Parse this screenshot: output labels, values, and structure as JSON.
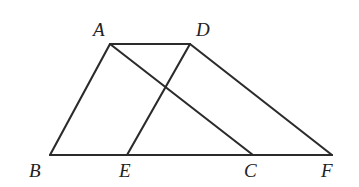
{
  "figure": {
    "background_color": "#ffffff",
    "stroke_color": "#2b2b2b",
    "label_color": "#23211f",
    "width": 359,
    "height": 187,
    "points": {
      "A": {
        "label": "A",
        "x": 110,
        "y": 44,
        "label_x": 93,
        "label_y": 20
      },
      "D": {
        "label": "D",
        "x": 190,
        "y": 44,
        "label_x": 196,
        "label_y": 20
      },
      "B": {
        "label": "B",
        "x": 50,
        "y": 155,
        "label_x": 29,
        "label_y": 161
      },
      "E": {
        "label": "E",
        "x": 127,
        "y": 155,
        "label_x": 119,
        "label_y": 161
      },
      "C": {
        "label": "C",
        "x": 253,
        "y": 155,
        "label_x": 244,
        "label_y": 161
      },
      "F": {
        "label": "F",
        "x": 332,
        "y": 155,
        "label_x": 321,
        "label_y": 161
      }
    },
    "segments": [
      {
        "name": "segment-BF-baseline",
        "from": "B",
        "to": "F"
      },
      {
        "name": "segment-BA",
        "from": "B",
        "to": "A"
      },
      {
        "name": "segment-AD",
        "from": "A",
        "to": "D"
      },
      {
        "name": "segment-AC",
        "from": "A",
        "to": "C"
      },
      {
        "name": "segment-ED",
        "from": "E",
        "to": "D"
      },
      {
        "name": "segment-DF",
        "from": "D",
        "to": "F"
      }
    ],
    "intersection": {
      "name": "intersection-AC-ED",
      "x": 163,
      "y": 86
    }
  }
}
